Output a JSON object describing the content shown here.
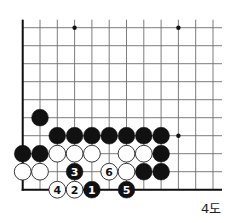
{
  "caption": "4도",
  "board": {
    "cols": 12,
    "rows": 10,
    "origin_x": 22.7,
    "origin_y": 27.7,
    "spacing_x": 17.3,
    "spacing_y": 18,
    "stone_radius": 8.4,
    "line_color": "#6e6e6e",
    "edge_color": "#111111",
    "open_top": true,
    "open_right": true,
    "edges": [
      "left",
      "bottom"
    ],
    "star_points": [
      {
        "col": 3,
        "row": 0
      },
      {
        "col": 9,
        "row": 0
      },
      {
        "col": 9,
        "row": 6
      }
    ]
  },
  "stones": [
    {
      "color": "black",
      "col": 1,
      "row": 5
    },
    {
      "color": "black",
      "col": 2,
      "row": 6
    },
    {
      "color": "black",
      "col": 3,
      "row": 6
    },
    {
      "color": "black",
      "col": 4,
      "row": 6
    },
    {
      "color": "black",
      "col": 5,
      "row": 6
    },
    {
      "color": "black",
      "col": 6,
      "row": 6
    },
    {
      "color": "black",
      "col": 7,
      "row": 6
    },
    {
      "color": "black",
      "col": 8,
      "row": 6
    },
    {
      "color": "black",
      "col": 0,
      "row": 7
    },
    {
      "color": "black",
      "col": 1,
      "row": 7
    },
    {
      "color": "white",
      "col": 2,
      "row": 7
    },
    {
      "color": "white",
      "col": 3,
      "row": 7
    },
    {
      "color": "white",
      "col": 4,
      "row": 7
    },
    {
      "color": "white",
      "col": 6,
      "row": 7
    },
    {
      "color": "white",
      "col": 7,
      "row": 7
    },
    {
      "color": "black",
      "col": 8,
      "row": 7
    },
    {
      "color": "white",
      "col": 0,
      "row": 8
    },
    {
      "color": "white",
      "col": 1,
      "row": 8
    },
    {
      "color": "black",
      "col": 3,
      "row": 8,
      "label": "3"
    },
    {
      "color": "white",
      "col": 5,
      "row": 8,
      "label": "6"
    },
    {
      "color": "white",
      "col": 6,
      "row": 8
    },
    {
      "color": "black",
      "col": 7,
      "row": 8
    },
    {
      "color": "black",
      "col": 8,
      "row": 8
    },
    {
      "color": "white",
      "col": 2,
      "row": 9,
      "label": "4"
    },
    {
      "color": "white",
      "col": 3,
      "row": 9,
      "label": "2"
    },
    {
      "color": "black",
      "col": 4,
      "row": 9,
      "label": "1"
    },
    {
      "color": "black",
      "col": 6,
      "row": 9,
      "label": "5"
    }
  ],
  "colors": {
    "black_stone": "#111111",
    "white_stone": "#ffffff",
    "white_stone_border": "#222222",
    "black_label": "#ffffff",
    "white_label": "#111111"
  }
}
